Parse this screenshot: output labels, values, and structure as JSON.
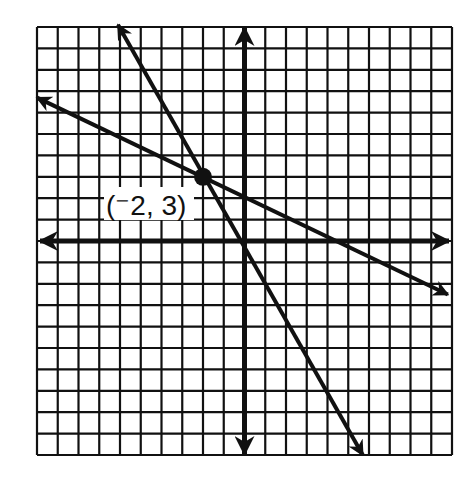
{
  "chart_data": {
    "type": "line",
    "title": "",
    "xlabel": "",
    "ylabel": "",
    "xlim": [
      -10,
      10
    ],
    "ylim": [
      -10,
      10
    ],
    "grid": true,
    "grid_step": 1,
    "axis_tick_labels": false,
    "series": [
      {
        "name": "steep-line",
        "equation": "y = -1.75x - 0.5",
        "slope": -1.75,
        "intercept": -0.5,
        "x": [
          -6.1,
          5.7
        ],
        "y": [
          10.1,
          -10.0
        ],
        "arrows": "both"
      },
      {
        "name": "shallow-line",
        "equation": "y = -0.5x + 2",
        "slope": -0.5,
        "intercept": 2,
        "x": [
          -10.0,
          9.8
        ],
        "y": [
          6.7,
          -2.5
        ],
        "arrows": "both"
      }
    ],
    "points": [
      {
        "x": -2,
        "y": 3,
        "label": "(⁻2, 3)"
      }
    ],
    "annotations": [
      "(⁻2, 3)"
    ]
  },
  "labels": {
    "intersection": "(⁻2, 3)"
  },
  "colors": {
    "ink": "#111111",
    "background": "#ffffff"
  }
}
